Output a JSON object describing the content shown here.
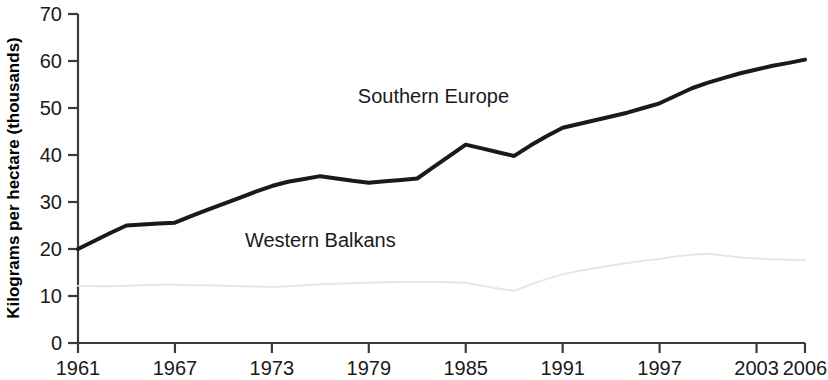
{
  "chart_data": {
    "type": "line",
    "title": "",
    "subtitle": "",
    "xlabel": "",
    "ylabel": "Kilograms per hectare (thousands)",
    "xlim": [
      1961,
      2006
    ],
    "ylim": [
      0,
      70
    ],
    "grid": false,
    "legend_position": "inline-annotations",
    "x_ticks": [
      "1961",
      "1967",
      "1973",
      "1979",
      "1985",
      "1991",
      "1997",
      "2003",
      "2006"
    ],
    "x_tick_values": [
      1961,
      1967,
      1973,
      1979,
      1985,
      1991,
      1997,
      2003,
      2006
    ],
    "y_ticks": [
      "0",
      "10",
      "20",
      "30",
      "40",
      "50",
      "60",
      "70"
    ],
    "y_tick_values": [
      0,
      10,
      20,
      30,
      40,
      50,
      60,
      70
    ],
    "x": [
      1961,
      1962,
      1963,
      1964,
      1965,
      1966,
      1967,
      1968,
      1969,
      1970,
      1971,
      1972,
      1973,
      1974,
      1975,
      1976,
      1977,
      1978,
      1979,
      1980,
      1981,
      1982,
      1983,
      1984,
      1985,
      1986,
      1987,
      1988,
      1989,
      1990,
      1991,
      1992,
      1993,
      1994,
      1995,
      1996,
      1997,
      1998,
      1999,
      2000,
      2001,
      2002,
      2003,
      2004,
      2005,
      2006
    ],
    "series": [
      {
        "name": "Southern Europe",
        "color": "#1a1a1a",
        "line_width": 4,
        "label_x": 1983,
        "label_y": 51,
        "values": [
          20.0,
          21.7,
          23.4,
          25.0,
          25.2,
          25.4,
          25.6,
          27.0,
          28.3,
          29.6,
          30.9,
          32.2,
          33.4,
          34.3,
          34.9,
          35.5,
          35.0,
          34.5,
          34.1,
          34.4,
          34.7,
          35.0,
          37.4,
          39.8,
          42.2,
          41.4,
          40.6,
          39.8,
          42.0,
          44.0,
          45.8,
          46.6,
          47.4,
          48.2,
          49.0,
          50.0,
          51.0,
          52.6,
          54.2,
          55.4,
          56.4,
          57.4,
          58.2,
          59.0,
          59.6,
          60.3
        ]
      },
      {
        "name": "Western Balkans",
        "color": "#e6e6e6",
        "line_width": 2,
        "label_x": 1976,
        "label_y": 20.5,
        "values": [
          12.2,
          12.1,
          12.1,
          12.2,
          12.3,
          12.4,
          12.4,
          12.3,
          12.3,
          12.2,
          12.1,
          12.0,
          11.9,
          12.1,
          12.3,
          12.5,
          12.6,
          12.7,
          12.8,
          12.9,
          13.0,
          13.0,
          13.0,
          12.9,
          12.8,
          12.2,
          11.6,
          11.1,
          12.4,
          13.6,
          14.6,
          15.3,
          15.9,
          16.5,
          17.0,
          17.5,
          17.9,
          18.4,
          18.8,
          19.0,
          18.6,
          18.2,
          18.0,
          17.8,
          17.7,
          17.6
        ]
      }
    ]
  },
  "axis": {
    "y_axis_title": "Kilograms per hectare (thousands)"
  }
}
